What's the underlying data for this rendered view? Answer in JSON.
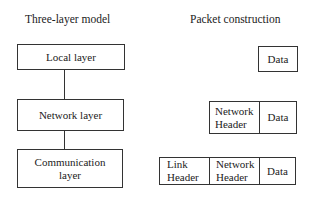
{
  "model": {
    "title": "Three-layer model",
    "layers": [
      {
        "label": "Local layer"
      },
      {
        "label": "Network layer"
      },
      {
        "label": "Communication layer",
        "lines": [
          "Communication",
          "layer"
        ]
      }
    ]
  },
  "packet": {
    "title": "Packet construction",
    "rows": [
      {
        "cells": [
          {
            "label": "Data"
          }
        ]
      },
      {
        "cells": [
          {
            "lines": [
              "Network",
              "Header"
            ]
          },
          {
            "label": "Data"
          }
        ]
      },
      {
        "cells": [
          {
            "lines": [
              "Link",
              "Header"
            ]
          },
          {
            "lines": [
              "Network",
              "Header"
            ]
          },
          {
            "label": "Data"
          }
        ]
      }
    ]
  }
}
